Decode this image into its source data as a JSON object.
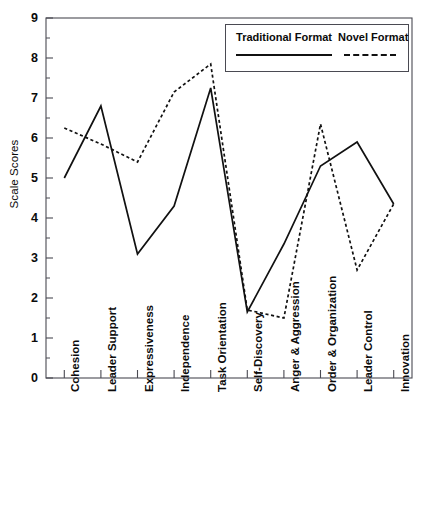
{
  "chart_data": {
    "type": "line",
    "title": "",
    "xlabel": "",
    "ylabel": "Scale Scores",
    "ylim": [
      0,
      9
    ],
    "yticks": [
      0,
      1,
      2,
      3,
      4,
      5,
      6,
      7,
      8,
      9
    ],
    "ytick_labels": [
      "0",
      "1",
      "2",
      "3",
      "4",
      "5",
      "6",
      "7",
      "8",
      "9"
    ],
    "grid": false,
    "legend_position": "top-right",
    "categories": [
      "Cohesion",
      "Leader Support",
      "Expressiveness",
      "Independence",
      "Task Orientation",
      "Self-Discovery",
      "Anger & Aggression",
      "Order & Organization",
      "Leader Control",
      "Innovation"
    ],
    "series": [
      {
        "name": "Traditional Format",
        "style": "solid",
        "color": "#111111",
        "values": [
          5.0,
          6.8,
          3.1,
          4.3,
          7.25,
          1.65,
          3.35,
          5.3,
          5.9,
          4.35
        ]
      },
      {
        "name": "Novel Format",
        "style": "dashed",
        "color": "#111111",
        "values": [
          6.25,
          5.85,
          5.4,
          7.15,
          7.85,
          1.7,
          1.5,
          6.35,
          2.7,
          4.35
        ]
      }
    ]
  },
  "legend": {
    "entries": [
      {
        "label": "Traditional Format"
      },
      {
        "label": "Novel Format"
      }
    ]
  },
  "clipped_header": {
    "text": ""
  }
}
